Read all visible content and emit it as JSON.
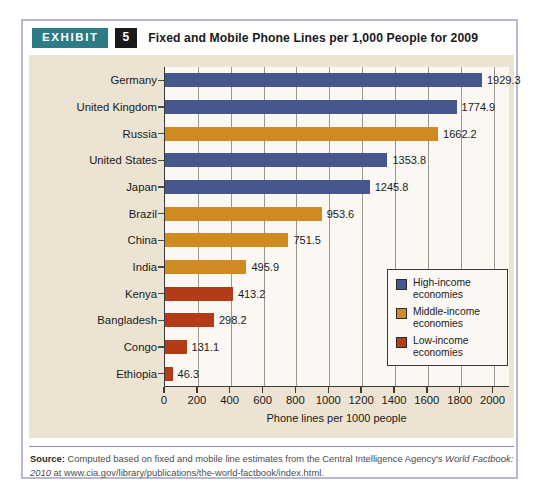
{
  "header": {
    "badge_label": "EXHIBIT",
    "exhibit_number": "5",
    "title": "Fixed and Mobile Phone Lines per 1,000 People for 2009"
  },
  "source": {
    "label": "Source:",
    "text_part1": " Computed based on fixed and mobile line estimates from the Central Intelligence Agency's ",
    "text_italic": "World Factbook: 2010",
    "text_part2": " at www.cia.gov/library/publications/the-world-factbook/index.html."
  },
  "colors": {
    "high_income": "#46578c",
    "middle_income": "#cf8a22",
    "low_income": "#b33c18",
    "panel_background": "#ece3d2",
    "plot_background": "#fbf8f3",
    "badge_teal": "#2c7c85",
    "number_black": "#1a1a1a",
    "border_lavender": "#b9b8d4"
  },
  "chart_data": {
    "type": "bar",
    "orientation": "horizontal",
    "title": "Fixed and Mobile Phone Lines per 1,000 People for 2009",
    "xlabel": "Phone lines per 1000 people",
    "ylabel": "",
    "xlim": [
      0,
      2100
    ],
    "xticks": [
      0,
      200,
      400,
      600,
      800,
      1000,
      1200,
      1400,
      1600,
      1800,
      2000
    ],
    "grid": "vertical",
    "legend_position": "right-inside",
    "categories": [
      "Germany",
      "United Kingdom",
      "Russia",
      "United States",
      "Japan",
      "Brazil",
      "China",
      "India",
      "Kenya",
      "Bangladesh",
      "Congo",
      "Ethiopia"
    ],
    "values": [
      1929.3,
      1774.9,
      1662.2,
      1353.8,
      1245.8,
      953.6,
      751.5,
      495.9,
      413.2,
      298.2,
      131.1,
      46.3
    ],
    "value_labels": [
      "1929.3",
      "1774.9",
      "1662.2",
      "1353.8",
      "1245.8",
      "953.6",
      "751.5",
      "495.9",
      "413.2",
      "298.2",
      "131.1",
      "46.3"
    ],
    "groups": [
      "high_income",
      "high_income",
      "middle_income",
      "high_income",
      "high_income",
      "middle_income",
      "middle_income",
      "middle_income",
      "low_income",
      "low_income",
      "low_income",
      "low_income"
    ],
    "legend": [
      {
        "key": "high_income",
        "label_line1": "High-income",
        "label_line2": "economies",
        "color": "#46578c"
      },
      {
        "key": "middle_income",
        "label_line1": "Middle-income",
        "label_line2": "economies",
        "color": "#cf8a22"
      },
      {
        "key": "low_income",
        "label_line1": "Low-income",
        "label_line2": "economies",
        "color": "#b33c18"
      }
    ]
  }
}
